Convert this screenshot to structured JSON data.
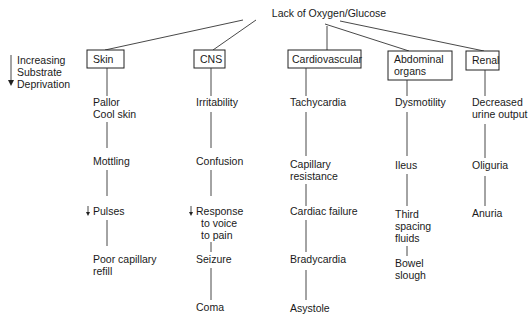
{
  "diagram": {
    "root": "Lack of Oxygen/Glucose",
    "legend": {
      "lines": [
        "Increasing",
        "Substrate",
        "Deprivation"
      ],
      "arrow_icon": "down-arrow"
    },
    "columns": [
      {
        "header": [
          "Skin"
        ],
        "items": [
          {
            "lines": [
              "Pallor",
              "Cool skin"
            ]
          },
          {
            "lines": [
              "Mottling"
            ]
          },
          {
            "lines": [
              "Pulses"
            ],
            "prefix_icon": "down-arrow"
          },
          {
            "lines": [
              "Poor capillary",
              "refill"
            ]
          }
        ]
      },
      {
        "header": [
          "CNS"
        ],
        "items": [
          {
            "lines": [
              "Irritability"
            ]
          },
          {
            "lines": [
              "Confusion"
            ]
          },
          {
            "lines": [
              "Response",
              "to voice",
              "to pain"
            ],
            "prefix_icon": "down-arrow"
          },
          {
            "lines": [
              "Seizure"
            ]
          },
          {
            "lines": [
              "Coma"
            ]
          }
        ]
      },
      {
        "header": [
          "Cardiovascular"
        ],
        "items": [
          {
            "lines": [
              "Tachycardia"
            ]
          },
          {
            "lines": [
              "Capillary",
              "resistance"
            ]
          },
          {
            "lines": [
              "Cardiac failure"
            ]
          },
          {
            "lines": [
              "Bradycardia"
            ]
          },
          {
            "lines": [
              "Asystole"
            ]
          }
        ]
      },
      {
        "header": [
          "Abdominal",
          "organs"
        ],
        "items": [
          {
            "lines": [
              "Dysmotility"
            ]
          },
          {
            "lines": [
              "Ileus"
            ]
          },
          {
            "lines": [
              "Third",
              "spacing",
              "fluids"
            ]
          },
          {
            "lines": [
              "Bowel",
              "slough"
            ]
          }
        ]
      },
      {
        "header": [
          "Renal"
        ],
        "items": [
          {
            "lines": [
              "Decreased",
              "urine output"
            ]
          },
          {
            "lines": [
              "Oliguria"
            ]
          },
          {
            "lines": [
              "Anuria"
            ]
          }
        ]
      }
    ]
  }
}
